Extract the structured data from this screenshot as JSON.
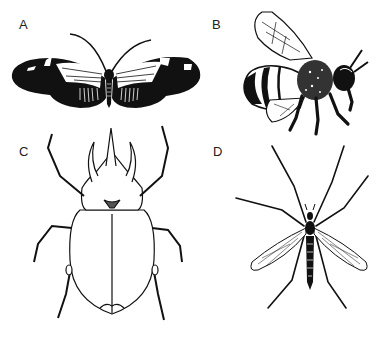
{
  "figure": {
    "panels": [
      {
        "id": "A",
        "label": "A",
        "subject": "butterfly",
        "icon": "butterfly-icon"
      },
      {
        "id": "B",
        "label": "B",
        "subject": "bee",
        "icon": "bee-icon"
      },
      {
        "id": "C",
        "label": "C",
        "subject": "horned-beetle",
        "icon": "beetle-icon"
      },
      {
        "id": "D",
        "label": "D",
        "subject": "crane-fly",
        "icon": "crane-fly-icon"
      }
    ],
    "colors": {
      "ink": "#111111",
      "background": "#ffffff"
    }
  }
}
